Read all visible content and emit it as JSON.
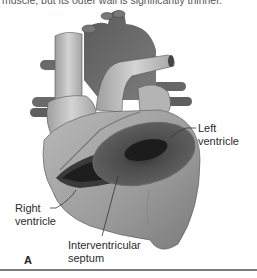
{
  "caption": {
    "top_text": "muscle, but its outer wall is significantly thinner."
  },
  "figure": {
    "panel_letter": "A",
    "labels": {
      "left_ventricle": [
        "Left",
        "ventricle"
      ],
      "right_ventricle": [
        "Right",
        "ventricle"
      ],
      "interventricular_septum": [
        "Interventricular",
        "septum"
      ]
    }
  },
  "colors": {
    "vessel_light": "#bdbdbd",
    "vessel_dark": "#6f6f6f",
    "muscle_cut": "#4a4a4a",
    "cavity": "#1e1e1e",
    "rule": "#7a7a7a"
  }
}
